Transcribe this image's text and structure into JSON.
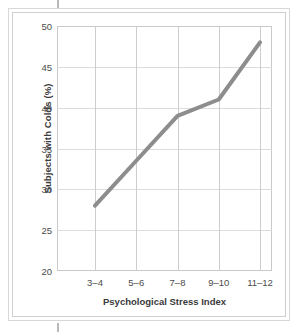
{
  "chart_data": {
    "type": "line",
    "title": "",
    "xlabel": "Psychological Stress Index",
    "ylabel": "Subjects with Colds (%)",
    "categories": [
      "3–4",
      "5–6",
      "7–8",
      "9–10",
      "11–12"
    ],
    "values": [
      28,
      33.5,
      39,
      41,
      48
    ],
    "series": [
      {
        "name": "Subjects with Colds (%)",
        "values": [
          28,
          33.5,
          39,
          41,
          48
        ]
      }
    ],
    "ylim": [
      20,
      50
    ],
    "yticks": [
      20,
      25,
      30,
      35,
      40,
      45,
      50
    ],
    "ytick_labels": [
      "20",
      "25",
      "30",
      "35",
      "40",
      "45",
      "50"
    ],
    "grid": true,
    "legend": "none",
    "line_color": "#8d8d8d",
    "grid_color": "#dcdcdc",
    "axis_color": "#c9c9c9",
    "text_color": "#4b4b4b"
  },
  "figure": {
    "background": "#ffffff",
    "frame_color": "#d8d8d8"
  }
}
